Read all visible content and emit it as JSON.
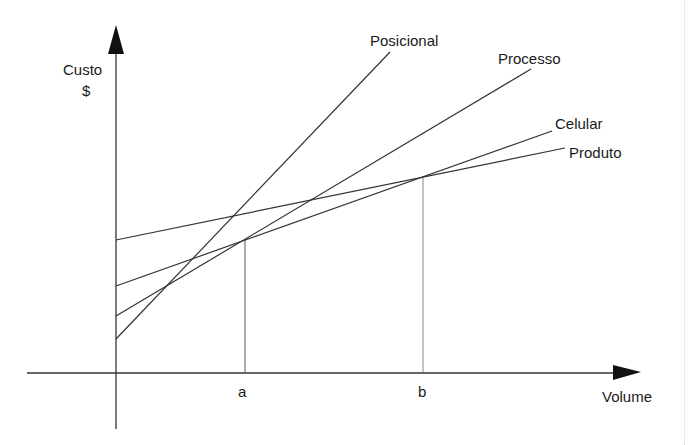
{
  "diagram": {
    "type": "cost-volume-line-diagram",
    "axes": {
      "y_label_line1": "Custo",
      "y_label_line2": "$",
      "x_label": "Volume"
    },
    "ticks": {
      "a": "a",
      "b": "b"
    },
    "lines": [
      {
        "name": "Posicional",
        "label": "Posicional",
        "x1": 116,
        "y1": 339,
        "x2": 390,
        "y2": 52
      },
      {
        "name": "Processo",
        "label": "Processo",
        "x1": 116,
        "y1": 316,
        "x2": 531,
        "y2": 69
      },
      {
        "name": "Celular",
        "label": "Celular",
        "x1": 116,
        "y1": 286,
        "x2": 552,
        "y2": 131
      },
      {
        "name": "Produto",
        "label": "Produto",
        "x1": 116,
        "y1": 240,
        "x2": 565,
        "y2": 148
      }
    ],
    "colors": {
      "line": "#333333",
      "text": "#1a1a1a",
      "background": "#ffffff"
    }
  }
}
